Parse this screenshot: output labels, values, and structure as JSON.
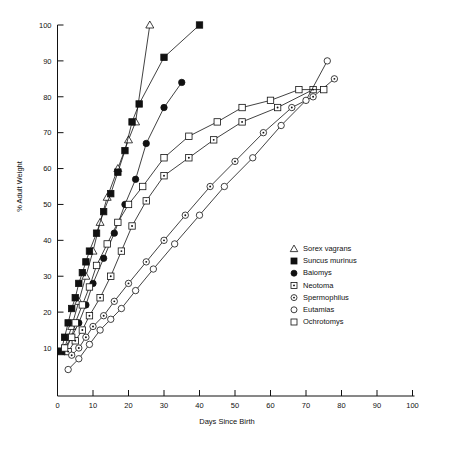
{
  "chart_data": {
    "type": "line",
    "title": "",
    "xlabel": "Days Since Birth",
    "ylabel": "% Adult Weight",
    "xlim": [
      0,
      100
    ],
    "ylim": [
      0,
      100
    ],
    "xticks": [
      0,
      10,
      20,
      30,
      40,
      50,
      60,
      70,
      80,
      90,
      100
    ],
    "xticklabels": [
      "0",
      "10",
      "20",
      "30",
      "40",
      "50",
      "60",
      "70",
      "80",
      "90",
      "100"
    ],
    "yticks": [
      10,
      20,
      30,
      40,
      50,
      60,
      70,
      80,
      90,
      100
    ],
    "yticklabels": [
      "10",
      "20",
      "30",
      "40",
      "50",
      "60",
      "70",
      "80",
      "90",
      "100"
    ],
    "grid": false,
    "legend_position": "right-center",
    "series": [
      {
        "name": "Sorex vagrans",
        "marker": "open-triangle",
        "points": [
          [
            2,
            10
          ],
          [
            4,
            16
          ],
          [
            6,
            23
          ],
          [
            8,
            30
          ],
          [
            10,
            37
          ],
          [
            12,
            45
          ],
          [
            14,
            52
          ],
          [
            17,
            60
          ],
          [
            20,
            68
          ],
          [
            22,
            73
          ],
          [
            26,
            100
          ]
        ]
      },
      {
        "name": "Suncus murinus",
        "marker": "filled-square",
        "points": [
          [
            1,
            9
          ],
          [
            2,
            13
          ],
          [
            3,
            17
          ],
          [
            4,
            21
          ],
          [
            5,
            24
          ],
          [
            6,
            28
          ],
          [
            7,
            31
          ],
          [
            8,
            34
          ],
          [
            9,
            37
          ],
          [
            11,
            42
          ],
          [
            13,
            48
          ],
          [
            15,
            53
          ],
          [
            17,
            59
          ],
          [
            19,
            65
          ],
          [
            21,
            73
          ],
          [
            23,
            78
          ],
          [
            30,
            91
          ],
          [
            40,
            100
          ]
        ]
      },
      {
        "name": "Baiomys",
        "marker": "filled-circle",
        "points": [
          [
            2,
            9
          ],
          [
            4,
            13
          ],
          [
            6,
            17
          ],
          [
            8,
            22
          ],
          [
            10,
            28
          ],
          [
            13,
            35
          ],
          [
            16,
            42
          ],
          [
            19,
            50
          ],
          [
            22,
            57
          ],
          [
            25,
            67
          ],
          [
            30,
            77
          ],
          [
            35,
            84
          ]
        ]
      },
      {
        "name": "Neotoma",
        "marker": "open-square-dot",
        "points": [
          [
            3,
            9
          ],
          [
            5,
            12
          ],
          [
            7,
            15
          ],
          [
            9,
            19
          ],
          [
            12,
            24
          ],
          [
            15,
            30
          ],
          [
            18,
            37
          ],
          [
            21,
            44
          ],
          [
            25,
            51
          ],
          [
            30,
            58
          ],
          [
            37,
            63
          ],
          [
            44,
            68
          ],
          [
            52,
            73
          ],
          [
            62,
            77
          ],
          [
            72,
            82
          ]
        ]
      },
      {
        "name": "Spermophilus",
        "marker": "open-circle-dot",
        "points": [
          [
            4,
            8
          ],
          [
            6,
            10
          ],
          [
            8,
            13
          ],
          [
            10,
            16
          ],
          [
            13,
            19
          ],
          [
            16,
            23
          ],
          [
            20,
            28
          ],
          [
            25,
            34
          ],
          [
            30,
            40
          ],
          [
            36,
            47
          ],
          [
            43,
            55
          ],
          [
            50,
            62
          ],
          [
            58,
            70
          ],
          [
            66,
            77
          ],
          [
            72,
            80
          ],
          [
            78,
            85
          ]
        ]
      },
      {
        "name": "Eutamias",
        "marker": "open-circle",
        "points": [
          [
            3,
            4
          ],
          [
            6,
            7
          ],
          [
            9,
            11
          ],
          [
            12,
            15
          ],
          [
            15,
            18
          ],
          [
            18,
            21
          ],
          [
            22,
            26
          ],
          [
            27,
            32
          ],
          [
            33,
            39
          ],
          [
            40,
            47
          ],
          [
            47,
            55
          ],
          [
            55,
            63
          ],
          [
            63,
            72
          ],
          [
            70,
            79
          ],
          [
            76,
            90
          ]
        ]
      },
      {
        "name": "Ochrotomys",
        "marker": "open-square",
        "points": [
          [
            2,
            10
          ],
          [
            4,
            13
          ],
          [
            5,
            17
          ],
          [
            7,
            22
          ],
          [
            9,
            27
          ],
          [
            11,
            33
          ],
          [
            14,
            39
          ],
          [
            17,
            45
          ],
          [
            20,
            50
          ],
          [
            24,
            55
          ],
          [
            30,
            63
          ],
          [
            37,
            69
          ],
          [
            45,
            73
          ],
          [
            52,
            77
          ],
          [
            60,
            79
          ],
          [
            68,
            82
          ],
          [
            75,
            82
          ]
        ]
      }
    ]
  },
  "legend": {
    "items": [
      {
        "label": "Sorex vagrans",
        "marker": "open-triangle"
      },
      {
        "label": "Suncus murinus",
        "marker": "filled-square"
      },
      {
        "label": "Baiomys",
        "marker": "filled-circle"
      },
      {
        "label": "Neotoma",
        "marker": "open-square-dot"
      },
      {
        "label": "Spermophilus",
        "marker": "open-circle-dot"
      },
      {
        "label": "Eutamias",
        "marker": "open-circle"
      },
      {
        "label": "Ochrotomys",
        "marker": "open-square"
      }
    ]
  }
}
